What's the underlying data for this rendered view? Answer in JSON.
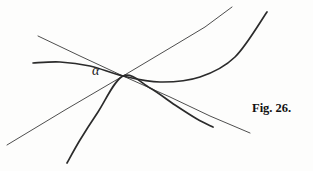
{
  "figure": {
    "caption": "Fig. 26.",
    "angle_label": "α",
    "background_color": "#fdfdfc",
    "ink_color": "#2b2b2b",
    "width": 313,
    "height": 171
  },
  "chart_data": {
    "type": "line",
    "title": "Fig. 26.",
    "xlabel": "",
    "ylabel": "",
    "xlim": [
      0,
      313
    ],
    "ylim": [
      171,
      0
    ],
    "grid": false,
    "legend": null,
    "annotations": [
      {
        "text": "α",
        "x": 99,
        "y": 75,
        "note": "angle label at common intersection point"
      },
      {
        "text": "Fig. 26.",
        "x": 280,
        "y": 112,
        "note": "figure caption"
      }
    ],
    "common_point": {
      "x": 123,
      "y": 76
    },
    "series": [
      {
        "name": "thin-line-upperleft-to-lowerright",
        "style": "thin-straight",
        "stroke_width": 0.9,
        "x": [
          38,
          80,
          123,
          170,
          210,
          250
        ],
        "y": [
          36,
          56,
          76,
          97,
          116,
          133
        ]
      },
      {
        "name": "thin-line-lowerleft-to-upperright",
        "style": "thin-straight",
        "stroke_width": 0.9,
        "x": [
          7,
          65,
          123,
          175,
          205,
          232
        ],
        "y": [
          145,
          110,
          76,
          45,
          27,
          7
        ]
      },
      {
        "name": "thick-curve-flat-left-rising-right",
        "style": "thick-curve",
        "stroke_width": 1.7,
        "x": [
          33,
          60,
          90,
          123,
          160,
          200,
          235,
          267
        ],
        "y": [
          63,
          62,
          66,
          76,
          82,
          77,
          57,
          12
        ]
      },
      {
        "name": "thick-curve-bottom-to-right",
        "style": "thick-curve",
        "stroke_width": 1.7,
        "x": [
          67,
          80,
          98,
          123,
          150,
          175,
          197,
          213
        ],
        "y": [
          163,
          140,
          112,
          76,
          88,
          105,
          119,
          127
        ]
      }
    ]
  }
}
